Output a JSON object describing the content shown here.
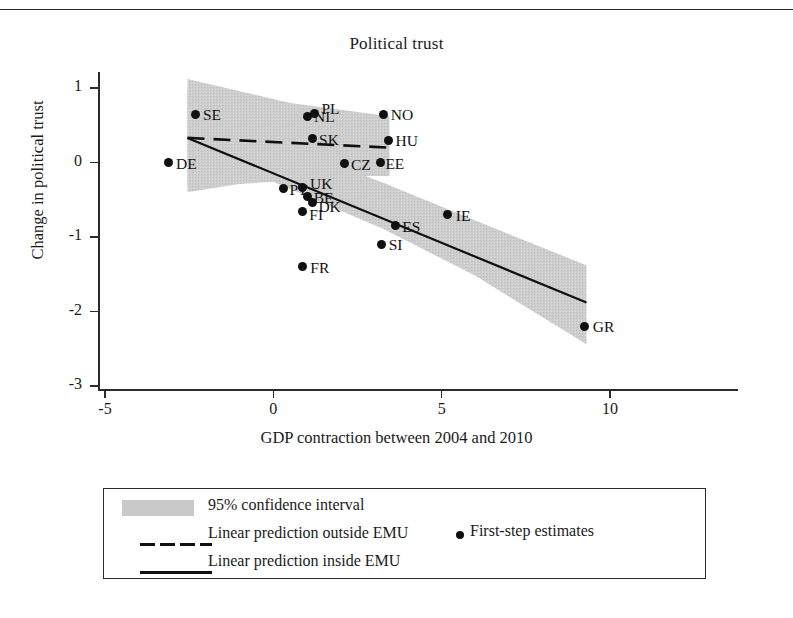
{
  "figure": {
    "title": "Political trust",
    "x_axis_title": "GDP contraction between 2004 and 2010",
    "y_axis_title": "Change in political trust"
  },
  "axes": {
    "x_ticks": [
      "-5",
      "0",
      "5",
      "10"
    ],
    "y_ticks": [
      "1",
      "0",
      "-1",
      "-2",
      "-3"
    ]
  },
  "legend": {
    "ci_label": "95% confidence interval",
    "outside_label": "Linear prediction outside EMU",
    "inside_label": "Linear prediction inside EMU",
    "points_label": "First-step estimates"
  },
  "colors": {
    "ci_band": "#c9c9c9",
    "line": "#101010",
    "axis": "#2b2b2b",
    "background": "#ffffff"
  },
  "chart_data": {
    "type": "scatter",
    "title": "Political trust",
    "xlabel": "GDP contraction between 2004 and 2010",
    "ylabel": "Change in political trust",
    "xlim": [
      -5,
      10
    ],
    "ylim": [
      -3,
      1
    ],
    "xticks": [
      -5,
      0,
      5,
      10
    ],
    "yticks": [
      1,
      0,
      -1,
      -2,
      -3
    ],
    "grid": false,
    "legend_position": "below-plot",
    "points": [
      {
        "label": "DE",
        "x": -3.1,
        "y": 0.0,
        "lx": 7,
        "ly": -7
      },
      {
        "label": "SE",
        "x": -2.3,
        "y": 0.65,
        "lx": 7,
        "ly": -7
      },
      {
        "label": "NL",
        "x": 1.0,
        "y": 0.62,
        "lx": 7,
        "ly": -7
      },
      {
        "label": "PL",
        "x": 1.22,
        "y": 0.66,
        "lx": 7,
        "ly": -12
      },
      {
        "label": "SK",
        "x": 1.15,
        "y": 0.32,
        "lx": 7,
        "ly": -7
      },
      {
        "label": "NO",
        "x": 3.28,
        "y": 0.65,
        "lx": 7,
        "ly": -7
      },
      {
        "label": "HU",
        "x": 3.42,
        "y": 0.3,
        "lx": 7,
        "ly": -7
      },
      {
        "label": "EE",
        "x": 3.18,
        "y": 0.0,
        "lx": 5,
        "ly": -7
      },
      {
        "label": "CZ",
        "x": 2.1,
        "y": -0.02,
        "lx": 7,
        "ly": -7
      },
      {
        "label": "PT",
        "x": 0.3,
        "y": -0.35,
        "lx": 6,
        "ly": -7
      },
      {
        "label": "UK",
        "x": 0.88,
        "y": -0.33,
        "lx": 7,
        "ly": -11
      },
      {
        "label": "BE",
        "x": 1.02,
        "y": -0.46,
        "lx": 6,
        "ly": -7
      },
      {
        "label": "DK",
        "x": 1.16,
        "y": -0.54,
        "lx": 6,
        "ly": -4
      },
      {
        "label": "FI",
        "x": 0.86,
        "y": -0.66,
        "lx": 7,
        "ly": -5
      },
      {
        "label": "FR",
        "x": 0.86,
        "y": -1.4,
        "lx": 8,
        "ly": -7
      },
      {
        "label": "SI",
        "x": 3.22,
        "y": -1.1,
        "lx": 7,
        "ly": -7
      },
      {
        "label": "ES",
        "x": 3.62,
        "y": -0.85,
        "lx": 7,
        "ly": -7
      },
      {
        "label": "IE",
        "x": 5.18,
        "y": -0.7,
        "lx": 8,
        "ly": -7
      },
      {
        "label": "GR",
        "x": 9.25,
        "y": -2.2,
        "lx": 8,
        "ly": -7
      }
    ],
    "series": [
      {
        "name": "Linear prediction inside EMU",
        "style": "solid",
        "x0": -2.55,
        "y0": 0.33,
        "x1": 9.3,
        "y1": -1.88,
        "ci_upper": [
          {
            "x": -2.55,
            "y": 0.97
          },
          {
            "x": 0.0,
            "y": 0.3
          },
          {
            "x": 3.3,
            "y": -0.28
          },
          {
            "x": 6.0,
            "y": -0.78
          },
          {
            "x": 9.3,
            "y": -1.38
          }
        ],
        "ci_lower": [
          {
            "x": -2.55,
            "y": -0.33
          },
          {
            "x": 0.0,
            "y": -0.26
          },
          {
            "x": 3.3,
            "y": -0.9
          },
          {
            "x": 6.0,
            "y": -1.52
          },
          {
            "x": 9.3,
            "y": -2.44
          }
        ]
      },
      {
        "name": "Linear prediction outside EMU",
        "style": "dashed",
        "x0": -2.55,
        "y0": 0.33,
        "x1": 3.45,
        "y1": 0.2,
        "ci_upper": [
          {
            "x": -2.55,
            "y": 1.12
          },
          {
            "x": 0.5,
            "y": 0.8
          },
          {
            "x": 3.45,
            "y": 0.62
          }
        ],
        "ci_lower": [
          {
            "x": -2.55,
            "y": -0.4
          },
          {
            "x": 0.5,
            "y": -0.18
          },
          {
            "x": 3.45,
            "y": -0.18
          }
        ]
      }
    ]
  }
}
